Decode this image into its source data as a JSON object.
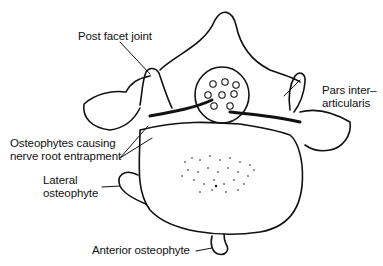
{
  "diagram": {
    "labels": {
      "post_facet_joint": "Post facet joint",
      "pars_line1": "Pars inter–",
      "pars_line2": "articularis",
      "osteophytes_line1": "Osteophytes causing",
      "osteophytes_line2": "nerve root entrapment",
      "lateral_line1": "Lateral",
      "lateral_line2": "osteophyte",
      "anterior": "Anterior osteophyte"
    },
    "colors": {
      "line": "#111111",
      "background": "#ffffff"
    }
  }
}
